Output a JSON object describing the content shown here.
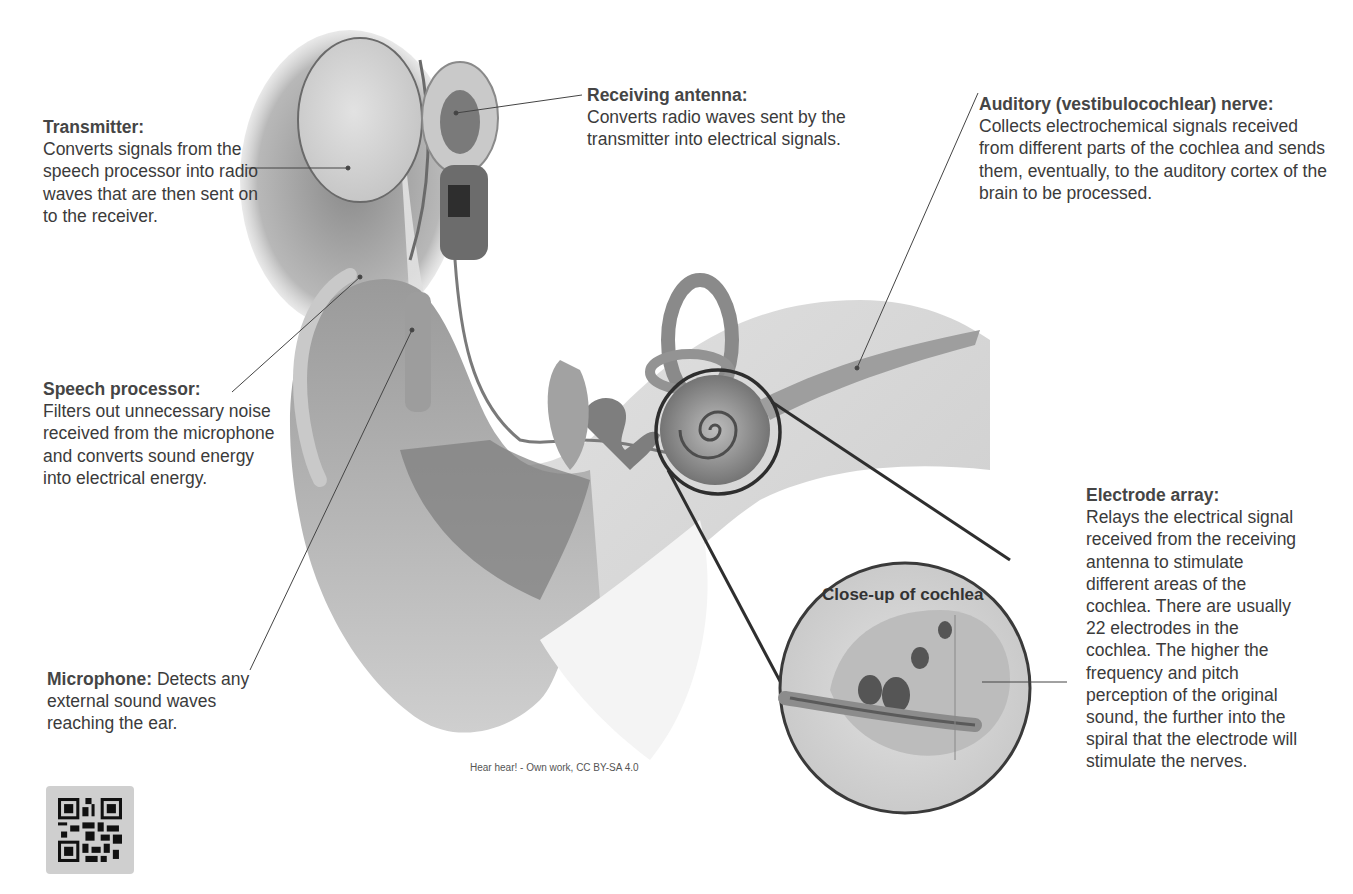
{
  "diagram": {
    "colors": {
      "background": "#ffffff",
      "text": "#3b3b3b",
      "leader_line": "#444444",
      "closeup_ring": "#2e2e2e"
    }
  },
  "labels": {
    "transmitter": {
      "title": "Transmitter:",
      "body": "Converts signals from the speech processor into radio waves that are then sent on to the receiver."
    },
    "receiving_antenna": {
      "title": "Receiving antenna:",
      "body": "Converts radio waves sent by the transmitter into electrical signals."
    },
    "auditory_nerve": {
      "title": "Auditory (vestibulocochlear) nerve:",
      "body": "Collects electrochemical signals received from different parts of the cochlea and sends them, eventually, to the auditory cortex of the brain to be processed."
    },
    "speech_processor": {
      "title": "Speech processor:",
      "body": "Filters out unnecessary noise received from the microphone and converts sound energy into electrical energy."
    },
    "electrode_array": {
      "title": "Electrode array:",
      "body": "Relays the electrical signal received from the receiving antenna to stimulate different areas of the cochlea. There are usually 22 electrodes in the cochlea. The higher the frequency and pitch perception of the original sound, the further into the spiral that the electrode will stimulate the nerves."
    },
    "microphone": {
      "title": "Microphone:",
      "body": "Detects any external sound waves reaching the ear."
    }
  },
  "closeup": {
    "title": "Close-up of cochlea"
  },
  "caption": "Hear hear! - Own work, CC BY-SA 4.0",
  "icons": {
    "qr_code": "qr-code-icon"
  }
}
